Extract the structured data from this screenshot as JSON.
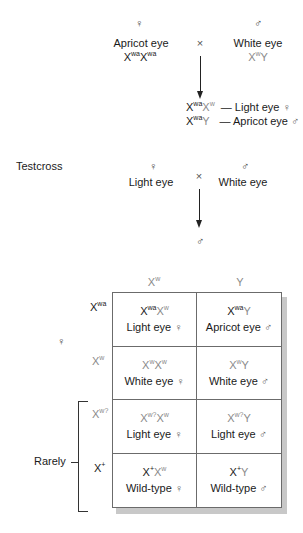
{
  "top_fragment": "...",
  "cross1": {
    "female_symbol": "♀",
    "male_symbol": "♂",
    "female_phenotype": "Apricot eye",
    "male_phenotype": "White eye",
    "cross_symbol": "×",
    "female_genotype": {
      "allele1": {
        "base": "X",
        "sup": "w",
        "sup2": "a"
      },
      "allele2": {
        "base": "X",
        "sup": "w",
        "sup2": "a"
      }
    },
    "male_genotype": {
      "x": "X",
      "x_sup": "w",
      "y": "Y"
    },
    "offspring": [
      {
        "genotype_a": "X",
        "genotype_a_sup": "wa",
        "genotype_b": "X",
        "genotype_b_sup": "w",
        "dash": "—",
        "phenotype": "Light eye",
        "sex": "♀"
      },
      {
        "genotype_a": "X",
        "genotype_a_sup": "wa",
        "genotype_b": "Y",
        "genotype_b_sup": "",
        "dash": "—",
        "phenotype": "Apricot eye",
        "sex": "♂"
      }
    ]
  },
  "testcross": {
    "label": "Testcross",
    "female_symbol": "♀",
    "male_symbol": "♂",
    "female_phenotype": "Light eye",
    "male_phenotype": "White eye",
    "cross_symbol": "×",
    "result_symbol": "♂"
  },
  "punnett": {
    "column_headers": [
      {
        "base": "X",
        "sup": "w",
        "color": "#8a8a8a"
      },
      {
        "base": "Y",
        "sup": "",
        "color": "#8a8a8a"
      }
    ],
    "row_headers": [
      {
        "base": "X",
        "sup": "wa",
        "color": "#1a1a1a"
      },
      {
        "base": "X",
        "sup": "w",
        "color": "#8a8a8a"
      },
      {
        "base": "X",
        "sup": "w?",
        "color": "#8a8a8a"
      },
      {
        "base": "X",
        "sup": "+",
        "color": "#1a1a1a"
      }
    ],
    "female_label": "♀",
    "rarely_label": "Rarely",
    "cells": [
      [
        {
          "g1": "X",
          "g1_sup": "wa",
          "g1_color": "#1a1a1a",
          "g2": "X",
          "g2_sup": "w",
          "g2_color": "#8a8a8a",
          "phenotype": "Light eye",
          "sex": "♀"
        },
        {
          "g1": "X",
          "g1_sup": "wa",
          "g1_color": "#1a1a1a",
          "g2": "Y",
          "g2_sup": "",
          "g2_color": "#8a8a8a",
          "phenotype": "Apricot eye",
          "sex": "♂"
        }
      ],
      [
        {
          "g1": "X",
          "g1_sup": "w",
          "g1_color": "#8a8a8a",
          "g2": "X",
          "g2_sup": "w",
          "g2_color": "#8a8a8a",
          "phenotype": "White eye",
          "sex": "♀"
        },
        {
          "g1": "X",
          "g1_sup": "w",
          "g1_color": "#8a8a8a",
          "g2": "Y",
          "g2_sup": "",
          "g2_color": "#8a8a8a",
          "phenotype": "White eye",
          "sex": "♂"
        }
      ],
      [
        {
          "g1": "X",
          "g1_sup": "w?",
          "g1_color": "#8a8a8a",
          "g2": "X",
          "g2_sup": "w",
          "g2_color": "#8a8a8a",
          "phenotype": "Light eye",
          "sex": "♀"
        },
        {
          "g1": "X",
          "g1_sup": "w?",
          "g1_color": "#8a8a8a",
          "g2": "Y",
          "g2_sup": "",
          "g2_color": "#8a8a8a",
          "phenotype": "Light eye",
          "sex": "♂"
        }
      ],
      [
        {
          "g1": "X",
          "g1_sup": "+",
          "g1_color": "#1a1a1a",
          "g2": "X",
          "g2_sup": "w",
          "g2_color": "#8a8a8a",
          "phenotype": "Wild-type",
          "sex": "♀"
        },
        {
          "g1": "X",
          "g1_sup": "+",
          "g1_color": "#1a1a1a",
          "g2": "Y",
          "g2_sup": "",
          "g2_color": "#8a8a8a",
          "phenotype": "Wild-type",
          "sex": "♂"
        }
      ]
    ]
  },
  "colors": {
    "dark_allele": "#1a1a1a",
    "gray_allele": "#8a8a8a",
    "grid_line": "#6b6b6b",
    "shadow": "#c8c8c8"
  }
}
